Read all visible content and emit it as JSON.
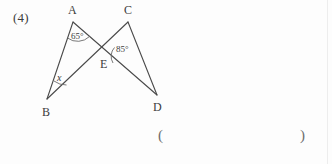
{
  "page": {
    "problem_number": "(4)",
    "background_color": "#fdfdfd",
    "ink_color": "#3c3c3c"
  },
  "figure": {
    "type": "geometry-diagram",
    "vertices": [
      {
        "name": "A",
        "label": "A",
        "x": 73,
        "y": 22,
        "label_x": 68,
        "label_y": 4
      },
      {
        "name": "C",
        "label": "C",
        "x": 128,
        "y": 22,
        "label_x": 124,
        "label_y": 4
      },
      {
        "name": "B",
        "label": "B",
        "x": 47,
        "y": 99,
        "label_x": 42,
        "label_y": 106
      },
      {
        "name": "D",
        "label": "D",
        "x": 157,
        "y": 95,
        "label_x": 153,
        "label_y": 101
      },
      {
        "name": "E",
        "label": "E",
        "x": 105,
        "y": 55,
        "label_x": 100,
        "label_y": 58
      }
    ],
    "segments": [
      {
        "name": "AB",
        "from": "A",
        "to": "B"
      },
      {
        "name": "AD",
        "from": "A",
        "to": "D"
      },
      {
        "name": "CB",
        "from": "C",
        "to": "B"
      },
      {
        "name": "CD",
        "from": "C",
        "to": "D"
      }
    ],
    "angles": [
      {
        "name": "angle-at-A",
        "vertex": "A",
        "value": "65°",
        "label_x": 71,
        "label_y": 32
      },
      {
        "name": "angle-at-E",
        "vertex": "E",
        "value": "85°",
        "label_x": 116,
        "label_y": 45
      },
      {
        "name": "angle-at-B",
        "vertex": "B",
        "value": "x",
        "label_x": 57,
        "label_y": 73
      }
    ]
  },
  "answer_blank": {
    "open_paren": "(",
    "close_paren": ")"
  }
}
